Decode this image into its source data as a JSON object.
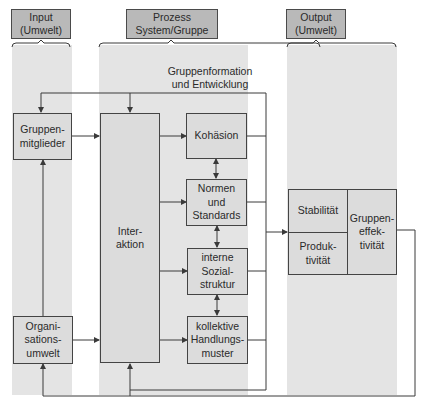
{
  "columns": {
    "input": {
      "header": "Input\n(Umwelt)"
    },
    "process": {
      "header": "Prozess\nSystem/Gruppe"
    },
    "output": {
      "header": "Output\n(Umwelt)"
    }
  },
  "feedback_label": "Gruppenformation\nund Entwicklung",
  "input_nodes": {
    "members": "Gruppen-\nmitglieder",
    "org_env": "Organi-\nsations-\numwelt"
  },
  "process_nodes": {
    "interaction": "Inter-\naktion",
    "cohesion": "Kohäsion",
    "norms": "Normen\nund\nStandards",
    "social_structure": "interne\nSozial-\nstruktur",
    "action_patterns": "kollektive\nHandlungs-\nmuster"
  },
  "output_nodes": {
    "stability": "Stabilität",
    "productivity": "Produk-\ntivität",
    "effectiveness": "Gruppen-\neffek-\ntivität"
  },
  "colors": {
    "column_shade": "#e4e4e4",
    "header_fill": "#b9b9b9",
    "box_fill": "#dcdcdc",
    "line": "#3a3a3a"
  }
}
